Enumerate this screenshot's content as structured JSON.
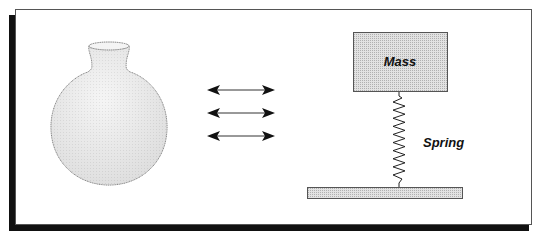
{
  "diagram": {
    "left_object": "round-bottom-flask",
    "connector": "double-headed-arrows",
    "arrow_count": 3,
    "right_object": "mass-spring-system",
    "labels": {
      "mass": "Mass",
      "spring": "Spring"
    },
    "colors": {
      "frame_border": "#555555",
      "shadow": "#111111",
      "flask_fill": "#e6e6e6",
      "mass_fill": "#dcdcdc",
      "base_fill": "#cccccc",
      "line": "#222222"
    }
  }
}
